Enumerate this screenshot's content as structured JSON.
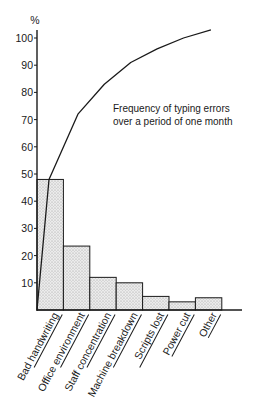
{
  "chart_data": {
    "type": "bar",
    "subtype": "pareto",
    "title": "",
    "annotation": [
      "Frequency of typing errors",
      "over a period of one month"
    ],
    "ylabel": "%",
    "xlabel": "",
    "ylim": [
      0,
      100
    ],
    "yticks": [
      10,
      20,
      30,
      40,
      50,
      60,
      70,
      80,
      90,
      100
    ],
    "grid": false,
    "legend": null,
    "categories": [
      "Bad handwriting",
      "Office environment",
      "Staff concentration",
      "Machine breakdown",
      "Scripts lost",
      "Power cut",
      "Other"
    ],
    "series": [
      {
        "name": "Frequency (%)",
        "type": "bar",
        "values": [
          48,
          23.5,
          12,
          10,
          5,
          3,
          4.5
        ]
      },
      {
        "name": "Cumulative (%)",
        "type": "line",
        "values": [
          48,
          72,
          83,
          91,
          96,
          100,
          103
        ]
      }
    ],
    "colors": {
      "bar_fill": "#e6e6e6",
      "stroke": "#1a1a1a",
      "background": "#ffffff"
    }
  }
}
